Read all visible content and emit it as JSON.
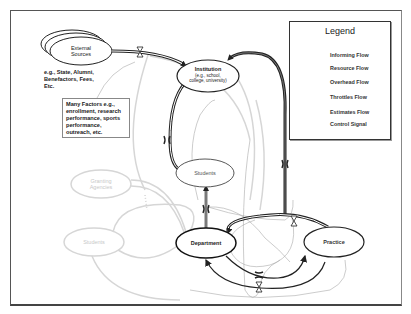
{
  "diagram": {
    "nodes": {
      "external_sources": {
        "label": "External Sources"
      },
      "institution": {
        "label": "Institution",
        "sublabel": "(e.g., school, college, university)"
      },
      "students": {
        "label": "Students"
      },
      "granting_agencies": {
        "label": "Granting Agencies"
      },
      "students_faded": {
        "label": "Students"
      },
      "department": {
        "label": "Department"
      },
      "practice": {
        "label": "Practice"
      }
    },
    "notes": {
      "external_examples": "e.g., State, Alumni, Benefactors, Fees, Etc.",
      "many_factors": "Many Factors e.g., enrollment, research performance, sports performance, outreach, etc."
    },
    "colors": {
      "primary_line": "#222222",
      "faded_line": "#d4d4d4",
      "control_signal": "#aaaaaa",
      "frame": "#555555"
    }
  },
  "legend": {
    "title": "Legend",
    "items": [
      {
        "label": "Informing Flow",
        "symbol": "single-arrow"
      },
      {
        "label": "Resource Flow",
        "symbol": "double-arrow"
      },
      {
        "label": "Overhead Flow",
        "symbol": "double-arrow-dark"
      },
      {
        "label": "Throttles Flow",
        "symbol": "hourglass"
      },
      {
        "label": "Estimates Flow",
        "symbol": "brackets"
      },
      {
        "label": "Control Signal",
        "symbol": "thin-line"
      }
    ]
  }
}
